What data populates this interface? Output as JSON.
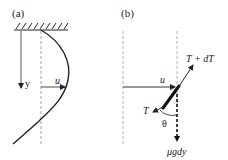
{
  "panel_a": {
    "label": "(a)",
    "y_label": "y",
    "u_label": "u"
  },
  "panel_b": {
    "label": "(b)",
    "u_label": "u",
    "tension_top_label": "T + dT",
    "tension_bottom_label": "T",
    "angle_label": "θ",
    "weight_label": "μgdy"
  },
  "colors": {
    "line": "#222222",
    "dashed": "#999999"
  }
}
